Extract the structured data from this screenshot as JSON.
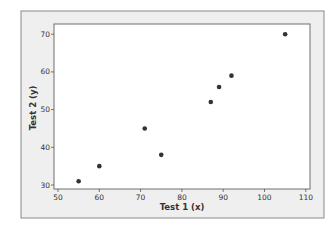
{
  "chart_data": {
    "type": "scatter",
    "title": "",
    "xlabel": "Test 1 (x)",
    "ylabel": "Test 2 (y)",
    "xlim": [
      49.5,
      111
    ],
    "ylim": [
      29.5,
      73.5
    ],
    "xticks": [
      50,
      60,
      70,
      80,
      90,
      100,
      110
    ],
    "yticks": [
      30,
      40,
      50,
      60,
      70
    ],
    "grid": false,
    "legend": null,
    "series": [
      {
        "name": "Test scores",
        "color": "#333333",
        "points": [
          {
            "x": 55,
            "y": 31
          },
          {
            "x": 60,
            "y": 35
          },
          {
            "x": 71,
            "y": 45
          },
          {
            "x": 75,
            "y": 38
          },
          {
            "x": 87,
            "y": 52
          },
          {
            "x": 89,
            "y": 56
          },
          {
            "x": 92,
            "y": 59
          },
          {
            "x": 105,
            "y": 70
          }
        ]
      }
    ]
  },
  "colors": {
    "outer_background": "#efefef",
    "plot_background": "#ffffff",
    "frame": "#8a8a8a",
    "text": "#333333"
  }
}
